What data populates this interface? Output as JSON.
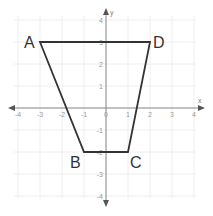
{
  "chart_data": {
    "type": "scatter",
    "title": "",
    "xlabel": "x",
    "ylabel": "y",
    "xlim": [
      -4,
      4
    ],
    "ylim": [
      -4,
      4
    ],
    "grid": true,
    "x_ticks": [
      -4,
      -3,
      -2,
      -1,
      0,
      1,
      2,
      3,
      4
    ],
    "y_ticks": [
      -4,
      -3,
      -2,
      -1,
      1,
      2,
      3,
      4
    ],
    "polygon": {
      "name": "Trapezoid ABCD",
      "closed": true,
      "stroke_color": "#333333",
      "vertices": [
        {
          "label": "A",
          "x": -3,
          "y": 3
        },
        {
          "label": "B",
          "x": -1,
          "y": -2
        },
        {
          "label": "C",
          "x": 1,
          "y": -2
        },
        {
          "label": "D",
          "x": 2,
          "y": 3
        }
      ]
    }
  },
  "layout": {
    "origin_px": [
      106,
      108
    ],
    "unit_px": 22,
    "grid_color": "#eeeeee",
    "axis_color": "#8a8a8a"
  }
}
